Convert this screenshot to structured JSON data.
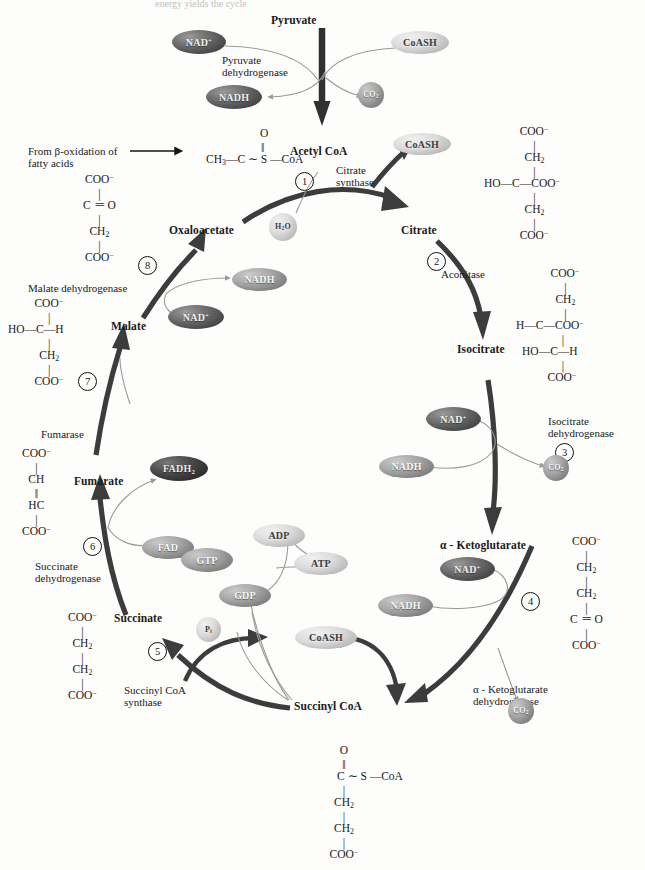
{
  "figure": {
    "title": "Pyruvate",
    "cut_header": "energy yields            the       cycle",
    "type": "citric-acid-cycle-diagram"
  },
  "metabolites": {
    "pyruvate": "Pyruvate",
    "acetyl_coa": "Acetyl CoA",
    "oxaloacetate": "Oxaloacetate",
    "citrate": "Citrate",
    "isocitrate": "Isocitrate",
    "alpha_ketoglutarate": "α - Ketoglutarate",
    "succinyl_coa": "Succinyl CoA",
    "succinate": "Succinate",
    "fumarate": "Fumarate",
    "malate": "Malate"
  },
  "enzymes": {
    "pyruvate_dehydrogenase": [
      "Pyruvate",
      "dehydrogenase"
    ],
    "citrate_synthase": [
      "Citrate",
      "synthase"
    ],
    "aconitase": [
      "Aconitase"
    ],
    "isocitrate_dehydrogenase": [
      "Isocitrate",
      "dehydrogenase"
    ],
    "alpha_kg_dehydrogenase": [
      "α - Ketoglutarate",
      "dehydrogenase"
    ],
    "succinyl_coa_synthase": [
      "Succinyl CoA",
      "synthase"
    ],
    "succinate_dehydrogenase": [
      "Succinate",
      "dehydrogenase"
    ],
    "fumarase": [
      "Fumarase"
    ],
    "malate_dehydrogenase": [
      "Malate dehydrogenase"
    ]
  },
  "steps": [
    "1",
    "2",
    "3",
    "4",
    "5",
    "6",
    "7",
    "8"
  ],
  "cofactors": {
    "nad_plus": "NAD+",
    "nadh": "NADH",
    "coash": "CoASH",
    "co2": "CO2",
    "h2o": "H2O",
    "fad": "FAD",
    "fadh2": "FADH2",
    "gtp": "GTP",
    "gdp": "GDP",
    "atp": "ATP",
    "adp": "ADP",
    "pi": "Pi"
  },
  "notes": {
    "beta_oxidation": [
      "From β-oxidation of",
      "fatty acids"
    ]
  },
  "structures": {
    "acetyl_coa": {
      "name": "Acetyl CoA",
      "lines": [
        "O",
        "‖",
        "CH3—C ∼ S —CoA"
      ]
    },
    "oxaloacetate": {
      "name": "Oxaloacetate",
      "lines": [
        "COO⁻",
        "|",
        "C ＝ O",
        "|",
        "CH2",
        "|",
        "COO⁻"
      ]
    },
    "citrate": {
      "name": "Citrate",
      "lines": [
        "COO⁻",
        "|",
        "CH2",
        "|",
        "HO—C—COO⁻",
        "|",
        "CH2",
        "|",
        "COO⁻"
      ]
    },
    "isocitrate": {
      "name": "Isocitrate",
      "lines": [
        "COO⁻",
        "|",
        "CH2",
        "|",
        "H—C—COO⁻",
        "|",
        "HO—C—H",
        "|",
        "COO⁻"
      ]
    },
    "alpha_ketoglutarate": {
      "name": "α - Ketoglutarate",
      "lines": [
        "COO⁻",
        "|",
        "CH2",
        "|",
        "CH2",
        "|",
        "C ＝ O",
        "|",
        "COO⁻"
      ]
    },
    "succinyl_coa": {
      "name": "Succinyl CoA",
      "lines": [
        "O",
        "‖",
        "C ∼ S —CoA",
        "|",
        "CH2",
        "|",
        "CH2",
        "|",
        "COO⁻"
      ]
    },
    "succinate": {
      "name": "Succinate",
      "lines": [
        "COO⁻",
        "|",
        "CH2",
        "|",
        "CH2",
        "|",
        "COO⁻"
      ]
    },
    "fumarate": {
      "name": "Fumarate",
      "lines": [
        "COO⁻",
        "|",
        "CH",
        "‖",
        "HC",
        "|",
        "COO⁻"
      ]
    },
    "malate": {
      "name": "Malate",
      "lines": [
        "COO⁻",
        "|",
        "HO—C—H",
        "|",
        "CH2",
        "|",
        "COO⁻"
      ]
    }
  },
  "colors": {
    "ink": "#1a1a1a",
    "cycle_arrow": "#3c3c3c",
    "thin_arrow": "#8a8a8a",
    "background": "#fdfdfb"
  }
}
